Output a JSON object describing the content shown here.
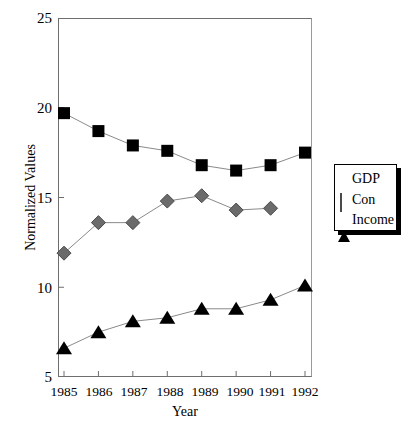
{
  "chart_data": {
    "type": "line",
    "title": "",
    "xlabel": "Year",
    "ylabel": "Normalized Values",
    "categories": [
      "1985",
      "1986",
      "1987",
      "1988",
      "1989",
      "1990",
      "1991",
      "1992"
    ],
    "x": [
      1985,
      1986,
      1987,
      1988,
      1989,
      1990,
      1991,
      1992
    ],
    "xlim": [
      1984.5,
      1992.5
    ],
    "ylim": [
      5,
      25
    ],
    "yticks": [
      5,
      10,
      15,
      20,
      25
    ],
    "ytick_labels": [
      "5",
      "10",
      "15",
      "20",
      "25"
    ],
    "xtick_labels": [
      "1985",
      "1986",
      "1987",
      "1988",
      "1989",
      "1990",
      "1991",
      "1992"
    ],
    "grid": false,
    "legend_position": "right",
    "series": [
      {
        "name": "GDP",
        "marker": "square",
        "color": "#000000",
        "line_color": "#8a8a8a",
        "values": [
          19.7,
          18.7,
          17.9,
          17.6,
          16.8,
          16.5,
          16.8,
          17.5
        ]
      },
      {
        "name": "Con",
        "marker": "diamond",
        "color": "#6b6b6b",
        "line_color": "#8a8a8a",
        "values": [
          11.9,
          13.6,
          13.6,
          14.8,
          15.1,
          14.3,
          14.4,
          null
        ]
      },
      {
        "name": "Income",
        "marker": "triangle",
        "color": "#000000",
        "line_color": "#8a8a8a",
        "values": [
          6.6,
          7.5,
          8.1,
          8.3,
          8.8,
          8.8,
          9.3,
          10.1
        ]
      }
    ],
    "legend": [
      "GDP",
      "Con",
      "Income"
    ]
  },
  "legend": {
    "items": [
      {
        "label": "GDP",
        "marker": "square-marker-icon"
      },
      {
        "label": "Con",
        "marker": "diamond-marker-icon"
      },
      {
        "label": "Income",
        "marker": "triangle-marker-icon"
      }
    ]
  },
  "colors": {
    "gdp": "#000000",
    "con": "#6b6b6b",
    "income": "#000000",
    "line": "#8a8a8a",
    "axis": "#6e6e6e",
    "background": "#ffffff"
  }
}
